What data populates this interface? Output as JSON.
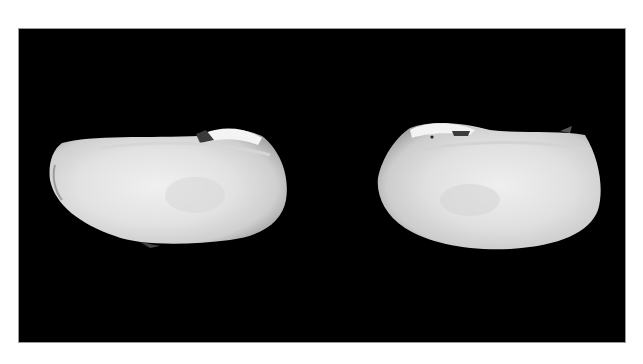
{
  "image": {
    "description": "Two bivalve shells (left and right valves) photographed on a black background",
    "background_color": "#000000",
    "margin_color": "#ffffff",
    "shell_color": "#e6e6e6",
    "shells": [
      {
        "id": "left-valve",
        "position": "left"
      },
      {
        "id": "right-valve",
        "position": "right"
      }
    ]
  }
}
